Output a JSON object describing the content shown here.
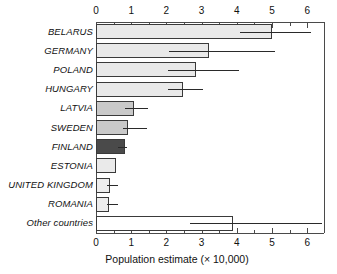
{
  "chart_data": {
    "type": "bar",
    "orientation": "horizontal",
    "title": "",
    "xlabel": "Population estimate (× 10,000)",
    "ylabel": "",
    "xlim": [
      0,
      6.48
    ],
    "xticks": [
      0,
      1,
      2,
      3,
      4,
      5,
      6
    ],
    "xticklabels": [
      "0",
      "1",
      "2",
      "3",
      "4",
      "5",
      "6"
    ],
    "minor_ticks": true,
    "grid": false,
    "legend": null,
    "axis_top": true,
    "axis_bottom": true,
    "error_bars": "asymmetric-range",
    "categories": [
      "BELARUS",
      "GERMANY",
      "POLAND",
      "HUNGARY",
      "LATVIA",
      "SWEDEN",
      "FINLAND",
      "ESTONIA",
      "UNITED KINGDOM",
      "ROMANIA",
      "Other countries"
    ],
    "values": [
      4.99,
      3.21,
      2.84,
      2.48,
      1.09,
      0.92,
      0.82,
      0.57,
      0.4,
      0.38,
      3.9
    ],
    "err_low": [
      4.09,
      2.07,
      2.05,
      2.05,
      0.82,
      0.78,
      0.62,
      null,
      0.3,
      0.3,
      2.67
    ],
    "err_high": [
      6.1,
      5.09,
      4.07,
      3.05,
      1.49,
      1.46,
      0.89,
      null,
      0.63,
      0.63,
      6.41
    ],
    "bar_colors": [
      "#e9e9e9",
      "#e9e9e9",
      "#e9e9e9",
      "#e9e9e9",
      "#c9c9c9",
      "#c9c9c9",
      "#4a4a4a",
      "#eaeaea",
      "#ededed",
      "#ededed",
      "#ffffff"
    ],
    "bar_edge_color": "#3a3a3a",
    "error_color": "#2a2a2a"
  }
}
